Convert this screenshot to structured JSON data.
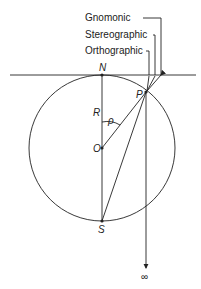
{
  "diagram": {
    "projections": [
      {
        "label": "Gnomonic",
        "x": 85,
        "y": 21
      },
      {
        "label": "Stereographic",
        "x": 85,
        "y": 38
      },
      {
        "label": "Orthographic",
        "x": 85,
        "y": 54
      }
    ],
    "points": {
      "N": "N",
      "S": "S",
      "O": "O",
      "P": "P",
      "R": "R",
      "rho": "ρ",
      "infinity": "∞"
    },
    "colors": {
      "ink": "#222222",
      "background": "#ffffff"
    }
  }
}
